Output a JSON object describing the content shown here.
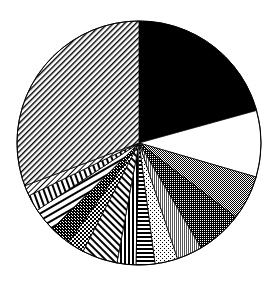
{
  "chart_data": {
    "type": "pie",
    "title": "",
    "center": [
      139,
      143
    ],
    "radius": 122,
    "start_angle_deg": 0,
    "direction": "clockwise",
    "legend": "none",
    "slices": [
      {
        "name": "slice-1",
        "share_pct": 20.7,
        "pattern": "solid-black"
      },
      {
        "name": "slice-2",
        "share_pct": 8.8,
        "pattern": "solid-white"
      },
      {
        "name": "slice-3",
        "share_pct": 5.9,
        "pattern": "gray-medium"
      },
      {
        "name": "slice-4",
        "share_pct": 6.1,
        "pattern": "gray-dark"
      },
      {
        "name": "slice-5",
        "share_pct": 3.4,
        "pattern": "gray-light-stripes"
      },
      {
        "name": "slice-6",
        "share_pct": 3.0,
        "pattern": "dots"
      },
      {
        "name": "slice-7",
        "share_pct": 2.5,
        "pattern": "horizontal-lines"
      },
      {
        "name": "slice-8",
        "share_pct": 2.5,
        "pattern": "vertical-lines"
      },
      {
        "name": "slice-9",
        "share_pct": 4.7,
        "pattern": "diagonal-down"
      },
      {
        "name": "slice-10",
        "share_pct": 2.2,
        "pattern": "checker"
      },
      {
        "name": "slice-11",
        "share_pct": 2.8,
        "pattern": "dark-checker"
      },
      {
        "name": "slice-12",
        "share_pct": 3.1,
        "pattern": "horizontal-hatch"
      },
      {
        "name": "slice-13",
        "share_pct": 2.2,
        "pattern": "vertical-stripes"
      },
      {
        "name": "slice-14",
        "share_pct": 1.4,
        "pattern": "diagonal-small"
      },
      {
        "name": "slice-15",
        "share_pct": 30.7,
        "pattern": "diagonal-up"
      }
    ]
  }
}
